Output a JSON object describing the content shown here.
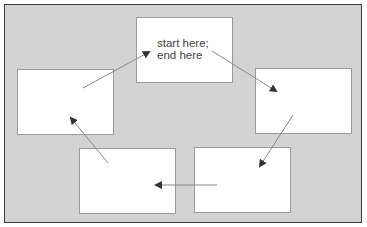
{
  "diagram": {
    "type": "cycle",
    "colors": {
      "background": "#d3d3d3",
      "box": "#ffffff",
      "border": "#3a3a3a",
      "arrow": "#777777"
    },
    "boxes": [
      {
        "id": "top",
        "label": "start here; end here",
        "x": 136,
        "y": 17,
        "w": 97,
        "h": 66
      },
      {
        "id": "right",
        "label": "",
        "x": 255,
        "y": 68,
        "w": 97,
        "h": 66
      },
      {
        "id": "bottom-right",
        "label": "",
        "x": 194,
        "y": 147,
        "w": 97,
        "h": 66
      },
      {
        "id": "bottom-left",
        "label": "",
        "x": 79,
        "y": 148,
        "w": 97,
        "h": 66
      },
      {
        "id": "left",
        "label": "",
        "x": 17,
        "y": 69,
        "w": 97,
        "h": 66
      }
    ],
    "arrows": [
      {
        "from": "top",
        "to": "right"
      },
      {
        "from": "right",
        "to": "bottom-right"
      },
      {
        "from": "bottom-right",
        "to": "bottom-left"
      },
      {
        "from": "bottom-left",
        "to": "left"
      },
      {
        "from": "left",
        "to": "top"
      }
    ]
  }
}
